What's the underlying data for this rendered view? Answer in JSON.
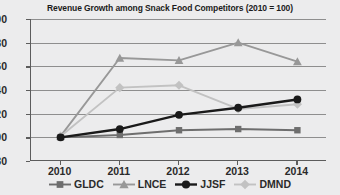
{
  "chart_data": {
    "type": "line",
    "title": "Revenue Growth among Snack Food Competitors (2010 = 100)",
    "xlabel": "",
    "ylabel": "",
    "categories": [
      "2010",
      "2011",
      "2012",
      "2013",
      "2014"
    ],
    "ylim": [
      80,
      200
    ],
    "yticks": [
      80,
      100,
      120,
      140,
      160,
      180,
      200
    ],
    "grid": true,
    "legend_position": "bottom",
    "series": [
      {
        "name": "GLDC",
        "color": "#6e6e6e",
        "marker": "square",
        "values": [
          100,
          102,
          106,
          107,
          106
        ]
      },
      {
        "name": "LNCE",
        "color": "#989898",
        "marker": "triangle",
        "values": [
          101,
          167,
          165,
          180,
          164
        ]
      },
      {
        "name": "JJSF",
        "color": "#1a1a1a",
        "marker": "circle",
        "values": [
          100,
          107,
          119,
          125,
          132
        ]
      },
      {
        "name": "DMND",
        "color": "#c2c2c2",
        "marker": "diamond",
        "values": [
          101,
          142,
          144,
          124,
          128
        ]
      }
    ]
  },
  "legend": {
    "items": [
      {
        "label": "GLDC"
      },
      {
        "label": "LNCE"
      },
      {
        "label": "JJSF"
      },
      {
        "label": "DMND"
      }
    ]
  }
}
